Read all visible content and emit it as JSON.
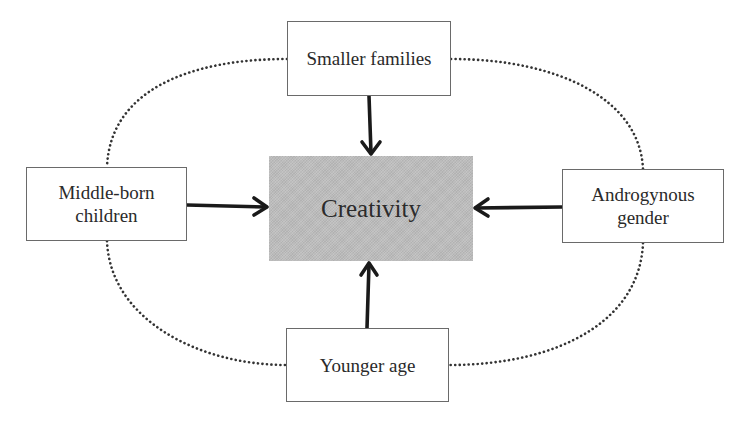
{
  "diagram": {
    "type": "influence-diagram",
    "central": {
      "label": "Creativity",
      "fill": "#bdbdbd"
    },
    "factors": [
      {
        "id": "top",
        "lines": [
          "Smaller families"
        ],
        "arrow_to": "central"
      },
      {
        "id": "left",
        "lines": [
          "Middle-born",
          "children"
        ],
        "arrow_to": "central"
      },
      {
        "id": "right",
        "lines": [
          "Androgynous",
          "gender"
        ],
        "arrow_to": "central"
      },
      {
        "id": "bottom",
        "lines": [
          "Younger age"
        ],
        "arrow_to": "central"
      }
    ],
    "connector": {
      "style": "dotted-ellipse",
      "color": "#333333"
    },
    "arrow_color": "#1a1a1a"
  }
}
